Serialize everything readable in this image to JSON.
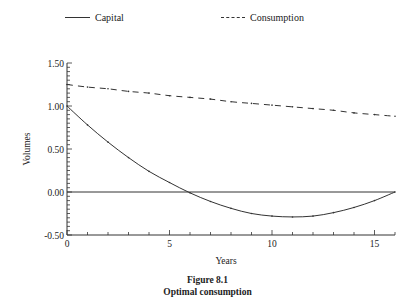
{
  "legend": {
    "items": [
      {
        "label": "Capital",
        "style": "solid"
      },
      {
        "label": "Consumption",
        "style": "dashed"
      }
    ]
  },
  "figure": {
    "number": "Figure 8.1",
    "title": "Optimal consumption"
  },
  "chart_data": {
    "type": "line",
    "title": "Optimal consumption",
    "xlabel": "Years",
    "ylabel": "Volumes",
    "xlim": [
      0,
      16
    ],
    "ylim": [
      -0.5,
      1.5
    ],
    "xticks": [
      0,
      5,
      10,
      15
    ],
    "yticks": [
      "-0.50",
      "0.00",
      "0.50",
      "1.00",
      "1.50"
    ],
    "grid": false,
    "legend_position": "top",
    "reference_line": {
      "y": 0.0,
      "style": "solid"
    },
    "x": [
      0,
      1,
      2,
      3,
      4,
      5,
      6,
      7,
      8,
      9,
      10,
      11,
      12,
      13,
      14,
      15,
      16
    ],
    "series": [
      {
        "name": "Capital",
        "style": "solid",
        "values": [
          1.0,
          0.78,
          0.58,
          0.4,
          0.24,
          0.11,
          -0.01,
          -0.11,
          -0.19,
          -0.25,
          -0.28,
          -0.29,
          -0.28,
          -0.24,
          -0.18,
          -0.1,
          0.0
        ]
      },
      {
        "name": "Consumption",
        "style": "dashed",
        "values": [
          1.25,
          1.22,
          1.2,
          1.17,
          1.15,
          1.12,
          1.1,
          1.08,
          1.05,
          1.03,
          1.01,
          0.99,
          0.97,
          0.95,
          0.92,
          0.9,
          0.88
        ]
      }
    ]
  }
}
